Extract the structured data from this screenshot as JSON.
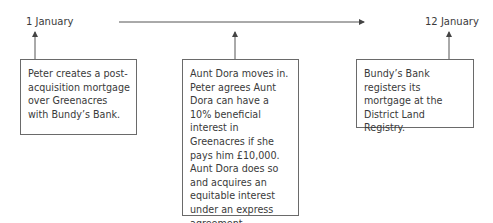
{
  "timeline": {
    "start_label": "1 January",
    "end_label": "12 January"
  },
  "events": [
    {
      "text": "Peter creates a post-acquisition mortgage over Greenacres with Bundy’s Bank."
    },
    {
      "text": "Aunt Dora moves in. Peter agrees Aunt Dora can have a 10% beneficial interest in Greenacres if she pays him £10,000.  Aunt Dora does so and acquires an equitable interest under an express agreement constructive trust."
    },
    {
      "text": "Bundy’s Bank registers its mortgage at the District Land Registry."
    }
  ],
  "colors": {
    "line": "#555555",
    "text": "#3a3a3a",
    "border": "#6a6a6a"
  }
}
